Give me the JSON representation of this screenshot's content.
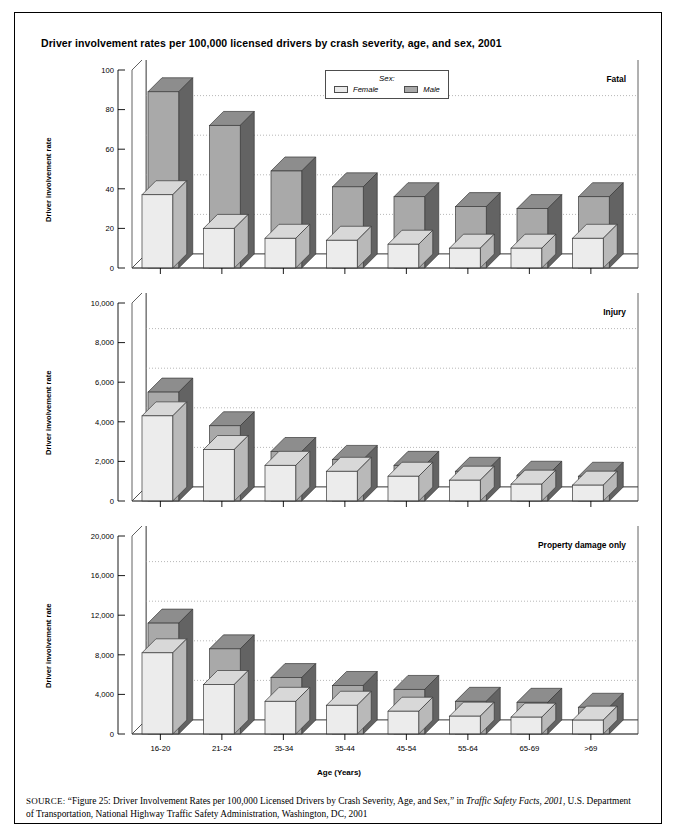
{
  "figure": {
    "title": "Driver involvement rates per 100,000 licensed drivers by crash severity, age, and sex, 2001",
    "axis_title_x": "Age (Years)",
    "axis_title_y": "Driver involvement rate"
  },
  "legend": {
    "title": "Sex:",
    "items": [
      {
        "label": "Female",
        "color": "#eaeaea"
      },
      {
        "label": "Male",
        "color": "#a9a9a9"
      }
    ]
  },
  "source": {
    "prefix": "SOURCE:",
    "text_before_italic": " “Figure 25: Driver Involvement Rates per 100,000 Licensed Drivers by Crash Severity, Age, and Sex,” in ",
    "italic": "Traffic Safety Facts, 2001",
    "text_after_italic": ", U.S. Department of Transportation, National Highway Traffic Safety Administration, Washington, DC, 2001"
  },
  "panels": [
    {
      "label": "Fatal",
      "ticks": [
        "0",
        "20",
        "40",
        "60",
        "80",
        "100"
      ],
      "ymax": 100
    },
    {
      "label": "Injury",
      "ticks": [
        "0",
        "2,000",
        "4,000",
        "6,000",
        "8,000",
        "10,000"
      ],
      "ymax": 10000
    },
    {
      "label": "Property damage only",
      "ticks": [
        "0",
        "4,000",
        "8,000",
        "12,000",
        "16,000",
        "20,000"
      ],
      "ymax": 20000
    }
  ],
  "chart_data": [
    {
      "type": "bar",
      "title": "Fatal",
      "xlabel": "Age (Years)",
      "ylabel": "Driver involvement rate",
      "ylim": [
        0,
        100
      ],
      "yticks": [
        0,
        20,
        40,
        60,
        80,
        100
      ],
      "grid": true,
      "legend_position": "top-center",
      "categories": [
        "16-20",
        "21-24",
        "25-34",
        "35-44",
        "45-54",
        "55-64",
        "65-69",
        ">69"
      ],
      "series": [
        {
          "name": "Female",
          "values": [
            37,
            20,
            15,
            14,
            12,
            10,
            10,
            15
          ]
        },
        {
          "name": "Male",
          "values": [
            89,
            72,
            49,
            41,
            36,
            31,
            30,
            36
          ]
        }
      ]
    },
    {
      "type": "bar",
      "title": "Injury",
      "xlabel": "Age (Years)",
      "ylabel": "Driver involvement rate",
      "ylim": [
        0,
        10000
      ],
      "yticks": [
        0,
        2000,
        4000,
        6000,
        8000,
        10000
      ],
      "grid": true,
      "categories": [
        "16-20",
        "21-24",
        "25-34",
        "35-44",
        "45-54",
        "55-64",
        "65-69",
        ">69"
      ],
      "series": [
        {
          "name": "Female",
          "values": [
            4300,
            2600,
            1800,
            1500,
            1250,
            1050,
            850,
            800
          ]
        },
        {
          "name": "Male",
          "values": [
            5500,
            3800,
            2500,
            2100,
            1800,
            1500,
            1300,
            1250
          ]
        }
      ]
    },
    {
      "type": "bar",
      "title": "Property damage only",
      "xlabel": "Age (Years)",
      "ylabel": "Driver involvement rate",
      "ylim": [
        0,
        20000
      ],
      "yticks": [
        0,
        4000,
        8000,
        12000,
        16000,
        20000
      ],
      "grid": true,
      "categories": [
        "16-20",
        "21-24",
        "25-34",
        "35-44",
        "45-54",
        "55-64",
        "65-69",
        ">69"
      ],
      "series": [
        {
          "name": "Female",
          "values": [
            8200,
            5000,
            3300,
            2900,
            2300,
            1800,
            1700,
            1400
          ]
        },
        {
          "name": "Male",
          "values": [
            11200,
            8600,
            5700,
            4900,
            4500,
            3300,
            3200,
            2700
          ]
        }
      ]
    }
  ]
}
